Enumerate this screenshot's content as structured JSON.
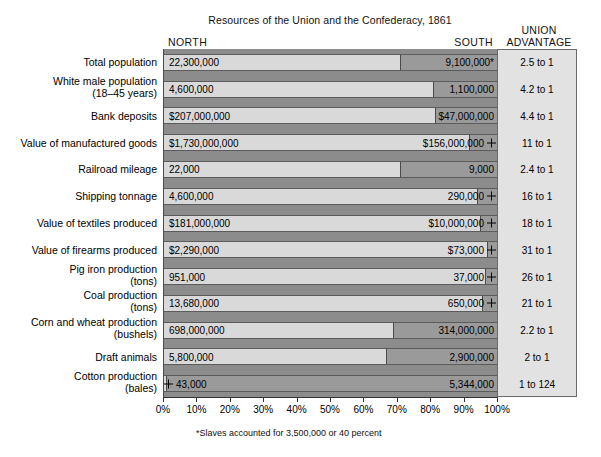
{
  "header": {
    "title": "Resources of the Union and the Confederacy, 1861",
    "north_label": "NORTH",
    "south_label": "SOUTH",
    "advantage_line1": "UNION",
    "advantage_line2": "ADVANTAGE"
  },
  "footnote": "*Slaves accounted for 3,500,000 or 40 percent",
  "colors": {
    "north_bar": "#d9d9d9",
    "south_bar": "#9a9a9a",
    "plot_background": "#8c8c8c",
    "advantage_background": "#e2e2e2"
  },
  "chart_data": {
    "type": "bar",
    "subtype": "100% stacked horizontal bar",
    "title": "Resources of the Union and the Confederacy, 1861",
    "xlabel": "",
    "ylabel": "",
    "xlim": [
      0,
      100
    ],
    "xticks": [
      "0%",
      "10%",
      "20%",
      "30%",
      "40%",
      "50%",
      "60%",
      "70%",
      "80%",
      "90%",
      "100%"
    ],
    "grid": false,
    "legend": [
      "NORTH",
      "SOUTH"
    ],
    "legend_position": "top (column headers)",
    "categories": [
      "Total population",
      "White male population (18–45 years)",
      "Bank deposits",
      "Value of manufactured goods",
      "Railroad mileage",
      "Shipping tonnage",
      "Value of textiles produced",
      "Value of firearms produced",
      "Pig iron production (tons)",
      "Coal production (tons)",
      "Corn and wheat production (bushels)",
      "Draft animals",
      "Cotton production (bales)"
    ],
    "rows": [
      {
        "category_line1": "Total population",
        "category_line2": "",
        "north_value": "22,300,000",
        "south_value": "9,100,000*",
        "advantage": "2.5 to 1",
        "north_pct": 71.0,
        "south_pct": 29.0,
        "south_marker": false
      },
      {
        "category_line1": "White male population",
        "category_line2": "(18–45 years)",
        "north_value": "4,600,000",
        "south_value": "1,100,000",
        "advantage": "4.2 to 1",
        "north_pct": 80.7,
        "south_pct": 19.3,
        "south_marker": false
      },
      {
        "category_line1": "Bank deposits",
        "category_line2": "",
        "north_value": "$207,000,000",
        "south_value": "$47,000,000",
        "advantage": "4.4 to 1",
        "north_pct": 81.5,
        "south_pct": 18.5,
        "south_marker": false
      },
      {
        "category_line1": "Value of manufactured goods",
        "category_line2": "",
        "north_value": "$1,730,000,000",
        "south_value": "$156,000,000",
        "advantage": "11 to 1",
        "north_pct": 91.7,
        "south_pct": 8.3,
        "south_marker": true
      },
      {
        "category_line1": "Railroad mileage",
        "category_line2": "",
        "north_value": "22,000",
        "south_value": "9,000",
        "advantage": "2.4 to 1",
        "north_pct": 71.0,
        "south_pct": 29.0,
        "south_marker": false
      },
      {
        "category_line1": "Shipping tonnage",
        "category_line2": "",
        "north_value": "4,600,000",
        "south_value": "290,000",
        "advantage": "16 to 1",
        "north_pct": 94.1,
        "south_pct": 5.9,
        "south_marker": true
      },
      {
        "category_line1": "Value of textiles produced",
        "category_line2": "",
        "north_value": "$181,000,000",
        "south_value": "$10,000,000",
        "advantage": "18 to 1",
        "north_pct": 94.8,
        "south_pct": 5.2,
        "south_marker": true
      },
      {
        "category_line1": "Value of firearms produced",
        "category_line2": "",
        "north_value": "$2,290,000",
        "south_value": "$73,000",
        "advantage": "31 to 1",
        "north_pct": 96.9,
        "south_pct": 3.1,
        "south_marker": true
      },
      {
        "category_line1": "Pig iron production",
        "category_line2": "(tons)",
        "north_value": "951,000",
        "south_value": "37,000",
        "advantage": "26 to 1",
        "north_pct": 96.3,
        "south_pct": 3.7,
        "south_marker": true
      },
      {
        "category_line1": "Coal production",
        "category_line2": "(tons)",
        "north_value": "13,680,000",
        "south_value": "650,000",
        "advantage": "21 to 1",
        "north_pct": 95.5,
        "south_pct": 4.5,
        "south_marker": true
      },
      {
        "category_line1": "Corn and wheat production",
        "category_line2": "(bushels)",
        "north_value": "698,000,000",
        "south_value": "314,000,000",
        "advantage": "2.2 to 1",
        "north_pct": 69.0,
        "south_pct": 31.0,
        "south_marker": false
      },
      {
        "category_line1": "Draft animals",
        "category_line2": "",
        "north_value": "5,800,000",
        "south_value": "2,900,000",
        "advantage": "2 to 1",
        "north_pct": 66.7,
        "south_pct": 33.3,
        "south_marker": false
      },
      {
        "category_line1": "Cotton production",
        "category_line2": "(bales)",
        "north_value": "43,000",
        "south_value": "5,344,000",
        "advantage": "1 to 124",
        "north_pct": 0.8,
        "south_pct": 99.2,
        "south_marker": false,
        "north_marker": true
      }
    ]
  }
}
